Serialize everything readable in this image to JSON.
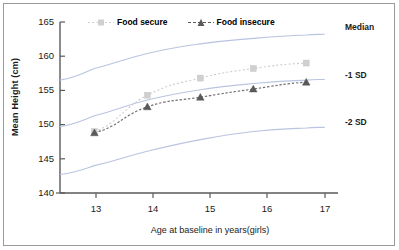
{
  "chart_data": {
    "type": "line",
    "title": "",
    "xlabel": "Age at baseline in years(girls)",
    "ylabel": "Mean Height (cm)",
    "xlim": [
      12.35,
      17.6
    ],
    "ylim": [
      140,
      165
    ],
    "xticks": [
      13,
      14,
      15,
      16,
      17
    ],
    "yticks": [
      140,
      145,
      150,
      155,
      160,
      165
    ],
    "grid": false,
    "legend_position": "top-left",
    "x": [
      13,
      14,
      15,
      16,
      17
    ],
    "series": [
      {
        "name": "Food secure",
        "marker": "square",
        "line_style": "dotted",
        "color": "#d0d0d0",
        "values": [
          149.0,
          154.3,
          156.8,
          158.2,
          159.0
        ]
      },
      {
        "name": "Food insecure",
        "marker": "triangle",
        "line_style": "dash-dot",
        "color": "#5a5a5a",
        "values": [
          148.8,
          152.6,
          154.0,
          155.2,
          156.2
        ]
      }
    ],
    "reference_curves": [
      {
        "name": "Median",
        "color": "#b9c4e0",
        "x": [
          12.35,
          13,
          14,
          15,
          16,
          17,
          17.35
        ],
        "values": [
          156.5,
          158.2,
          160.4,
          161.8,
          162.6,
          163.1,
          163.2
        ]
      },
      {
        "name": "-1 SD",
        "color": "#b9c4e0",
        "x": [
          12.35,
          13,
          14,
          15,
          16,
          17,
          17.35
        ],
        "values": [
          149.7,
          151.3,
          153.6,
          155.1,
          156.0,
          156.5,
          156.6
        ]
      },
      {
        "name": "-2 SD",
        "color": "#b9c4e0",
        "x": [
          12.35,
          13,
          14,
          15,
          16,
          17,
          17.35
        ],
        "values": [
          142.7,
          144.0,
          146.1,
          147.8,
          149.0,
          149.5,
          149.6
        ]
      }
    ],
    "annotations": [
      {
        "label": "Median",
        "x": 17.6,
        "y": 163.5
      },
      {
        "label": "-1 SD",
        "x": 17.6,
        "y": 156.8
      },
      {
        "label": "-2 SD",
        "x": 17.6,
        "y": 149.8
      }
    ]
  },
  "legend": {
    "entries": [
      {
        "label": "Food secure",
        "marker": "square-marker",
        "color": "#d0d0d0"
      },
      {
        "label": "Food insecure",
        "marker": "triangle-marker",
        "color": "#5a5a5a"
      }
    ]
  },
  "axes": {
    "y_title": "Mean Height (cm)",
    "x_title": "Age at baseline in years(girls)",
    "y_tick_labels": [
      "165",
      "160",
      "155",
      "150",
      "145",
      "140"
    ],
    "x_tick_labels": [
      "13",
      "14",
      "15",
      "16",
      "17"
    ]
  },
  "annotations": {
    "median": "Median",
    "minus1sd": "-1 SD",
    "minus2sd": "-2 SD"
  }
}
